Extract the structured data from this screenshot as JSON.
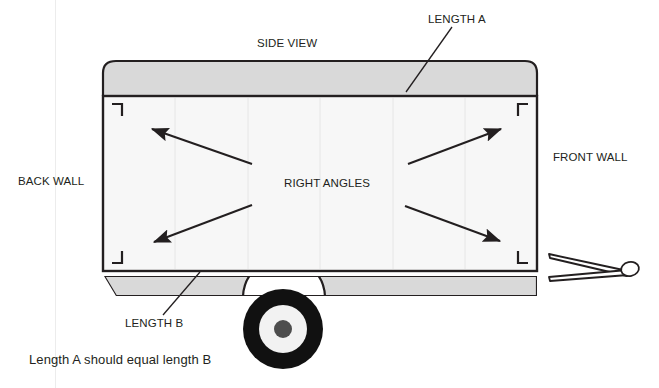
{
  "diagram": {
    "title": "SIDE VIEW",
    "labels": {
      "side_view": "SIDE VIEW",
      "length_a": "LENGTH A",
      "length_b": "LENGTH B",
      "back_wall": "BACK WALL",
      "front_wall": "FRONT WALL",
      "right_angles": "RIGHT ANGLES"
    },
    "caption": "Length A should equal length B",
    "colors": {
      "outline": "#231f20",
      "body_fill": "#f7f7f7",
      "roof_fill": "#d9d9d9",
      "chassis_fill": "#d9d9d9",
      "tire": "#111111",
      "rim": "#f2f2f2",
      "hub": "#4d4d4d",
      "background": "#ffffff",
      "text": "#231f20"
    },
    "parts": [
      {
        "name": "roof-band",
        "label": "roof"
      },
      {
        "name": "trailer-body",
        "label": "body"
      },
      {
        "name": "chassis-rail",
        "label": "chassis"
      },
      {
        "name": "wheel",
        "label": "wheel"
      },
      {
        "name": "tow-hitch",
        "label": "A-frame hitch"
      }
    ],
    "corner_markers": [
      {
        "name": "right-angle-marker-top-left",
        "corner": "top-left"
      },
      {
        "name": "right-angle-marker-top-right",
        "corner": "top-right"
      },
      {
        "name": "right-angle-marker-bottom-left",
        "corner": "bottom-left"
      },
      {
        "name": "right-angle-marker-bottom-right",
        "corner": "bottom-right"
      }
    ],
    "arrows": [
      {
        "name": "arrow-to-top-left-corner",
        "points_to": "top-left"
      },
      {
        "name": "arrow-to-top-right-corner",
        "points_to": "top-right"
      },
      {
        "name": "arrow-to-bottom-left-corner",
        "points_to": "bottom-left"
      },
      {
        "name": "arrow-to-bottom-right-corner",
        "points_to": "bottom-right"
      }
    ],
    "leader_lines": [
      {
        "name": "leader-line-length-a",
        "from_label": "LENGTH A",
        "to_part": "roof-band-top-edge"
      },
      {
        "name": "leader-line-length-b",
        "from_label": "LENGTH B",
        "to_part": "body-bottom-edge"
      }
    ]
  }
}
